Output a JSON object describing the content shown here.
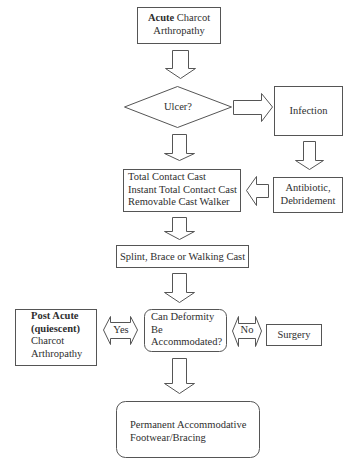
{
  "diagram": {
    "nodes": {
      "acute": {
        "bold": "Acute",
        "rest": " Charcot",
        "line2": "Arthropathy"
      },
      "ulcer": {
        "label": "Ulcer?"
      },
      "infection": {
        "label": "Infection"
      },
      "casts": {
        "line1": "Total Contact Cast",
        "line2": "Instant Total Contact Cast",
        "line3": "Removable Cast Walker"
      },
      "antibiotic": {
        "line1": "Antibiotic,",
        "line2": "Debridement"
      },
      "splint": {
        "label": "Splint, Brace or Walking Cast"
      },
      "post_acute": {
        "bold1": "Post Acute",
        "bold2": "(quiescent)",
        "line3": "Charcot",
        "line4": "Arthropathy"
      },
      "deformity": {
        "line1": "Can Deformity",
        "line2": "Be",
        "line3": "Accommodated?"
      },
      "surgery": {
        "label": "Surgery"
      },
      "permanent": {
        "line1": "Permanent Accommodative",
        "line2": "Footwear/Bracing"
      }
    },
    "edges": {
      "yes": "Yes",
      "no": "No"
    },
    "colors": {
      "stroke": "#555555",
      "text": "#2e2e2e",
      "background": "#ffffff"
    }
  }
}
